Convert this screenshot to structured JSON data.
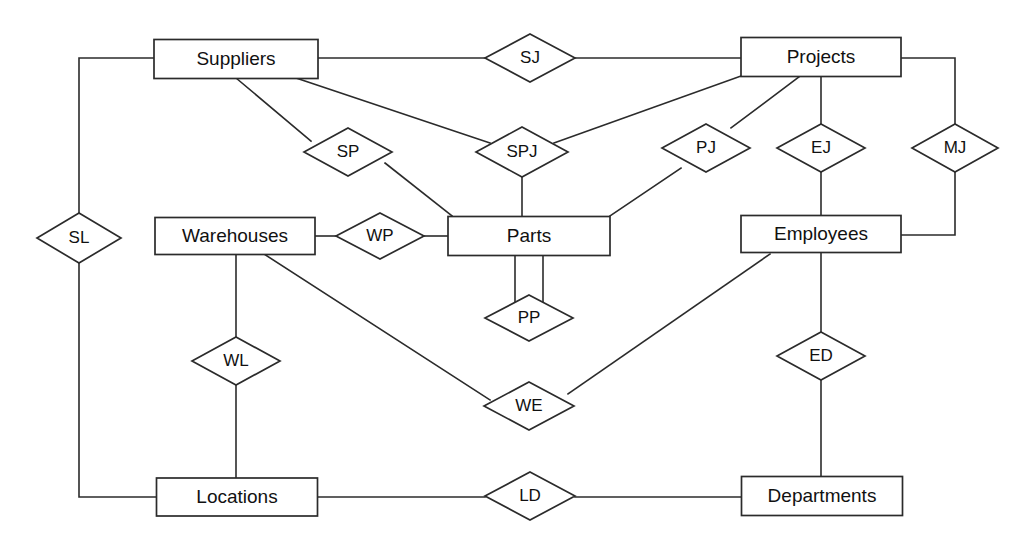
{
  "diagram": {
    "type": "er-diagram",
    "canvas": {
      "width": 1031,
      "height": 539
    },
    "style": {
      "background": "#ffffff",
      "line_color": "#2b2b2b",
      "text_color": "#111111",
      "shape_fill": "#ffffff"
    },
    "entities": [
      {
        "id": "suppliers",
        "label": "Suppliers",
        "x": 236,
        "y": 59,
        "w": 164,
        "h": 39
      },
      {
        "id": "projects",
        "label": "Projects",
        "x": 821,
        "y": 57,
        "w": 160,
        "h": 39
      },
      {
        "id": "warehouses",
        "label": "Warehouses",
        "x": 235,
        "y": 236,
        "w": 160,
        "h": 37
      },
      {
        "id": "parts",
        "label": "Parts",
        "x": 529,
        "y": 236,
        "w": 162,
        "h": 39
      },
      {
        "id": "employees",
        "label": "Employees",
        "x": 821,
        "y": 234,
        "w": 160,
        "h": 37
      },
      {
        "id": "locations",
        "label": "Locations",
        "x": 237,
        "y": 497,
        "w": 161,
        "h": 38
      },
      {
        "id": "departments",
        "label": "Departments",
        "x": 822,
        "y": 496,
        "w": 161,
        "h": 39
      }
    ],
    "relationships": [
      {
        "id": "sj",
        "label": "SJ",
        "x": 530,
        "y": 58,
        "w": 90,
        "h": 48,
        "connects": [
          "suppliers",
          "projects"
        ]
      },
      {
        "id": "sp",
        "label": "SP",
        "x": 348,
        "y": 152,
        "w": 88,
        "h": 48,
        "connects": [
          "suppliers",
          "parts"
        ]
      },
      {
        "id": "spj",
        "label": "SPJ",
        "x": 522,
        "y": 152,
        "w": 92,
        "h": 50,
        "connects": [
          "suppliers",
          "projects",
          "parts"
        ]
      },
      {
        "id": "pj",
        "label": "PJ",
        "x": 706,
        "y": 148,
        "w": 88,
        "h": 48,
        "connects": [
          "parts",
          "projects"
        ]
      },
      {
        "id": "ej",
        "label": "EJ",
        "x": 821,
        "y": 148,
        "w": 88,
        "h": 48,
        "connects": [
          "employees",
          "projects"
        ]
      },
      {
        "id": "mj",
        "label": "MJ",
        "x": 955,
        "y": 148,
        "w": 86,
        "h": 48,
        "connects": [
          "employees",
          "projects"
        ]
      },
      {
        "id": "sl",
        "label": "SL",
        "x": 79,
        "y": 238,
        "w": 84,
        "h": 50,
        "connects": [
          "suppliers",
          "locations"
        ]
      },
      {
        "id": "wp",
        "label": "WP",
        "x": 380,
        "y": 236,
        "w": 88,
        "h": 46,
        "connects": [
          "warehouses",
          "parts"
        ]
      },
      {
        "id": "pp",
        "label": "PP",
        "x": 529,
        "y": 318,
        "w": 88,
        "h": 46,
        "connects": [
          "parts",
          "parts"
        ]
      },
      {
        "id": "wl",
        "label": "WL",
        "x": 236,
        "y": 361,
        "w": 88,
        "h": 48,
        "connects": [
          "warehouses",
          "locations"
        ]
      },
      {
        "id": "we",
        "label": "WE",
        "x": 529,
        "y": 406,
        "w": 90,
        "h": 48,
        "connects": [
          "warehouses",
          "employees"
        ]
      },
      {
        "id": "ed",
        "label": "ED",
        "x": 821,
        "y": 356,
        "w": 88,
        "h": 48,
        "connects": [
          "employees",
          "departments"
        ]
      },
      {
        "id": "ld",
        "label": "LD",
        "x": 530,
        "y": 496,
        "w": 90,
        "h": 48,
        "connects": [
          "locations",
          "departments"
        ]
      }
    ],
    "edges": [
      {
        "id": "suppliers-sj",
        "from": "suppliers",
        "to": "sj",
        "points": "318,58 485,58"
      },
      {
        "id": "sj-projects",
        "from": "sj",
        "to": "projects",
        "points": "575,58 741,58"
      },
      {
        "id": "suppliers-sl",
        "from": "suppliers",
        "to": "sl",
        "points": "154,58 79,58 79,213"
      },
      {
        "id": "sl-locations",
        "from": "sl",
        "to": "locations",
        "points": "79,263 79,497 157,497"
      },
      {
        "id": "suppliers-sp",
        "from": "suppliers",
        "to": "sp",
        "points": "236,78 311,141"
      },
      {
        "id": "sp-parts",
        "from": "sp",
        "to": "parts",
        "points": "385,163 452,216"
      },
      {
        "id": "suppliers-spj",
        "from": "suppliers",
        "to": "spj",
        "points": "296,78 490,143"
      },
      {
        "id": "spj-parts",
        "from": "spj",
        "to": "parts",
        "points": "522,177 522,216"
      },
      {
        "id": "projects-spj",
        "from": "projects",
        "to": "spj",
        "points": "741,76 554,143"
      },
      {
        "id": "projects-pj",
        "from": "projects",
        "to": "pj",
        "points": "800,76 731,128"
      },
      {
        "id": "pj-parts",
        "from": "pj",
        "to": "parts",
        "points": "681,168 610,216"
      },
      {
        "id": "projects-ej",
        "from": "projects",
        "to": "ej",
        "points": "821,76 821,124"
      },
      {
        "id": "ej-employees",
        "from": "ej",
        "to": "employees",
        "points": "821,172 821,216"
      },
      {
        "id": "projects-mj",
        "from": "projects",
        "to": "mj",
        "points": "900,58 955,58 955,124"
      },
      {
        "id": "mj-employees",
        "from": "mj",
        "to": "employees",
        "points": "955,172 955,235 900,235"
      },
      {
        "id": "warehouses-wp",
        "from": "warehouses",
        "to": "wp",
        "points": "315,236 336,236"
      },
      {
        "id": "wp-parts",
        "from": "wp",
        "to": "parts",
        "points": "424,236 448,236"
      },
      {
        "id": "parts-pp-left",
        "from": "parts",
        "to": "pp",
        "points": "515,256 515,310"
      },
      {
        "id": "parts-pp-right",
        "from": "parts",
        "to": "pp",
        "points": "543,256 543,310"
      },
      {
        "id": "warehouses-wl",
        "from": "warehouses",
        "to": "wl",
        "points": "236,254 236,337"
      },
      {
        "id": "wl-locations",
        "from": "wl",
        "to": "locations",
        "points": "236,385 236,478"
      },
      {
        "id": "warehouses-we",
        "from": "warehouses",
        "to": "we",
        "points": "264,254 490,400"
      },
      {
        "id": "we-employees",
        "from": "we",
        "to": "employees",
        "points": "568,394 770,254"
      },
      {
        "id": "employees-ed",
        "from": "employees",
        "to": "ed",
        "points": "821,252 821,332"
      },
      {
        "id": "ed-departments",
        "from": "ed",
        "to": "departments",
        "points": "821,380 821,476"
      },
      {
        "id": "locations-ld",
        "from": "locations",
        "to": "ld",
        "points": "318,497 485,497"
      },
      {
        "id": "ld-departments",
        "from": "ld",
        "to": "departments",
        "points": "575,497 742,497"
      }
    ]
  }
}
